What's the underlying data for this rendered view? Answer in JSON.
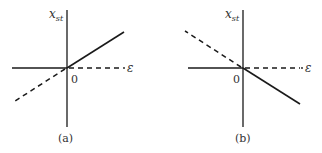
{
  "panels": [
    {
      "id": "a",
      "caption": "(a)",
      "y_axis_label": "x",
      "y_axis_label_sub": "st",
      "x_axis_label": "ε",
      "origin_label": "0",
      "description": "Solid: zero for negative ε, positive slope for positive ε. Dashed: extension of sloped line into negative ε and horizontal axis for positive ε."
    },
    {
      "id": "b",
      "caption": "(b)",
      "y_axis_label": "x",
      "y_axis_label_sub": "st",
      "x_axis_label": "ε",
      "origin_label": "0",
      "description": "Solid: zero for negative ε, negative slope for positive ε. Dashed: extension of sloped line into negative ε and horizontal axis for positive ε."
    }
  ],
  "colors": {
    "line": "#1a1a1a",
    "text": "#333333",
    "background": "#ffffff"
  }
}
